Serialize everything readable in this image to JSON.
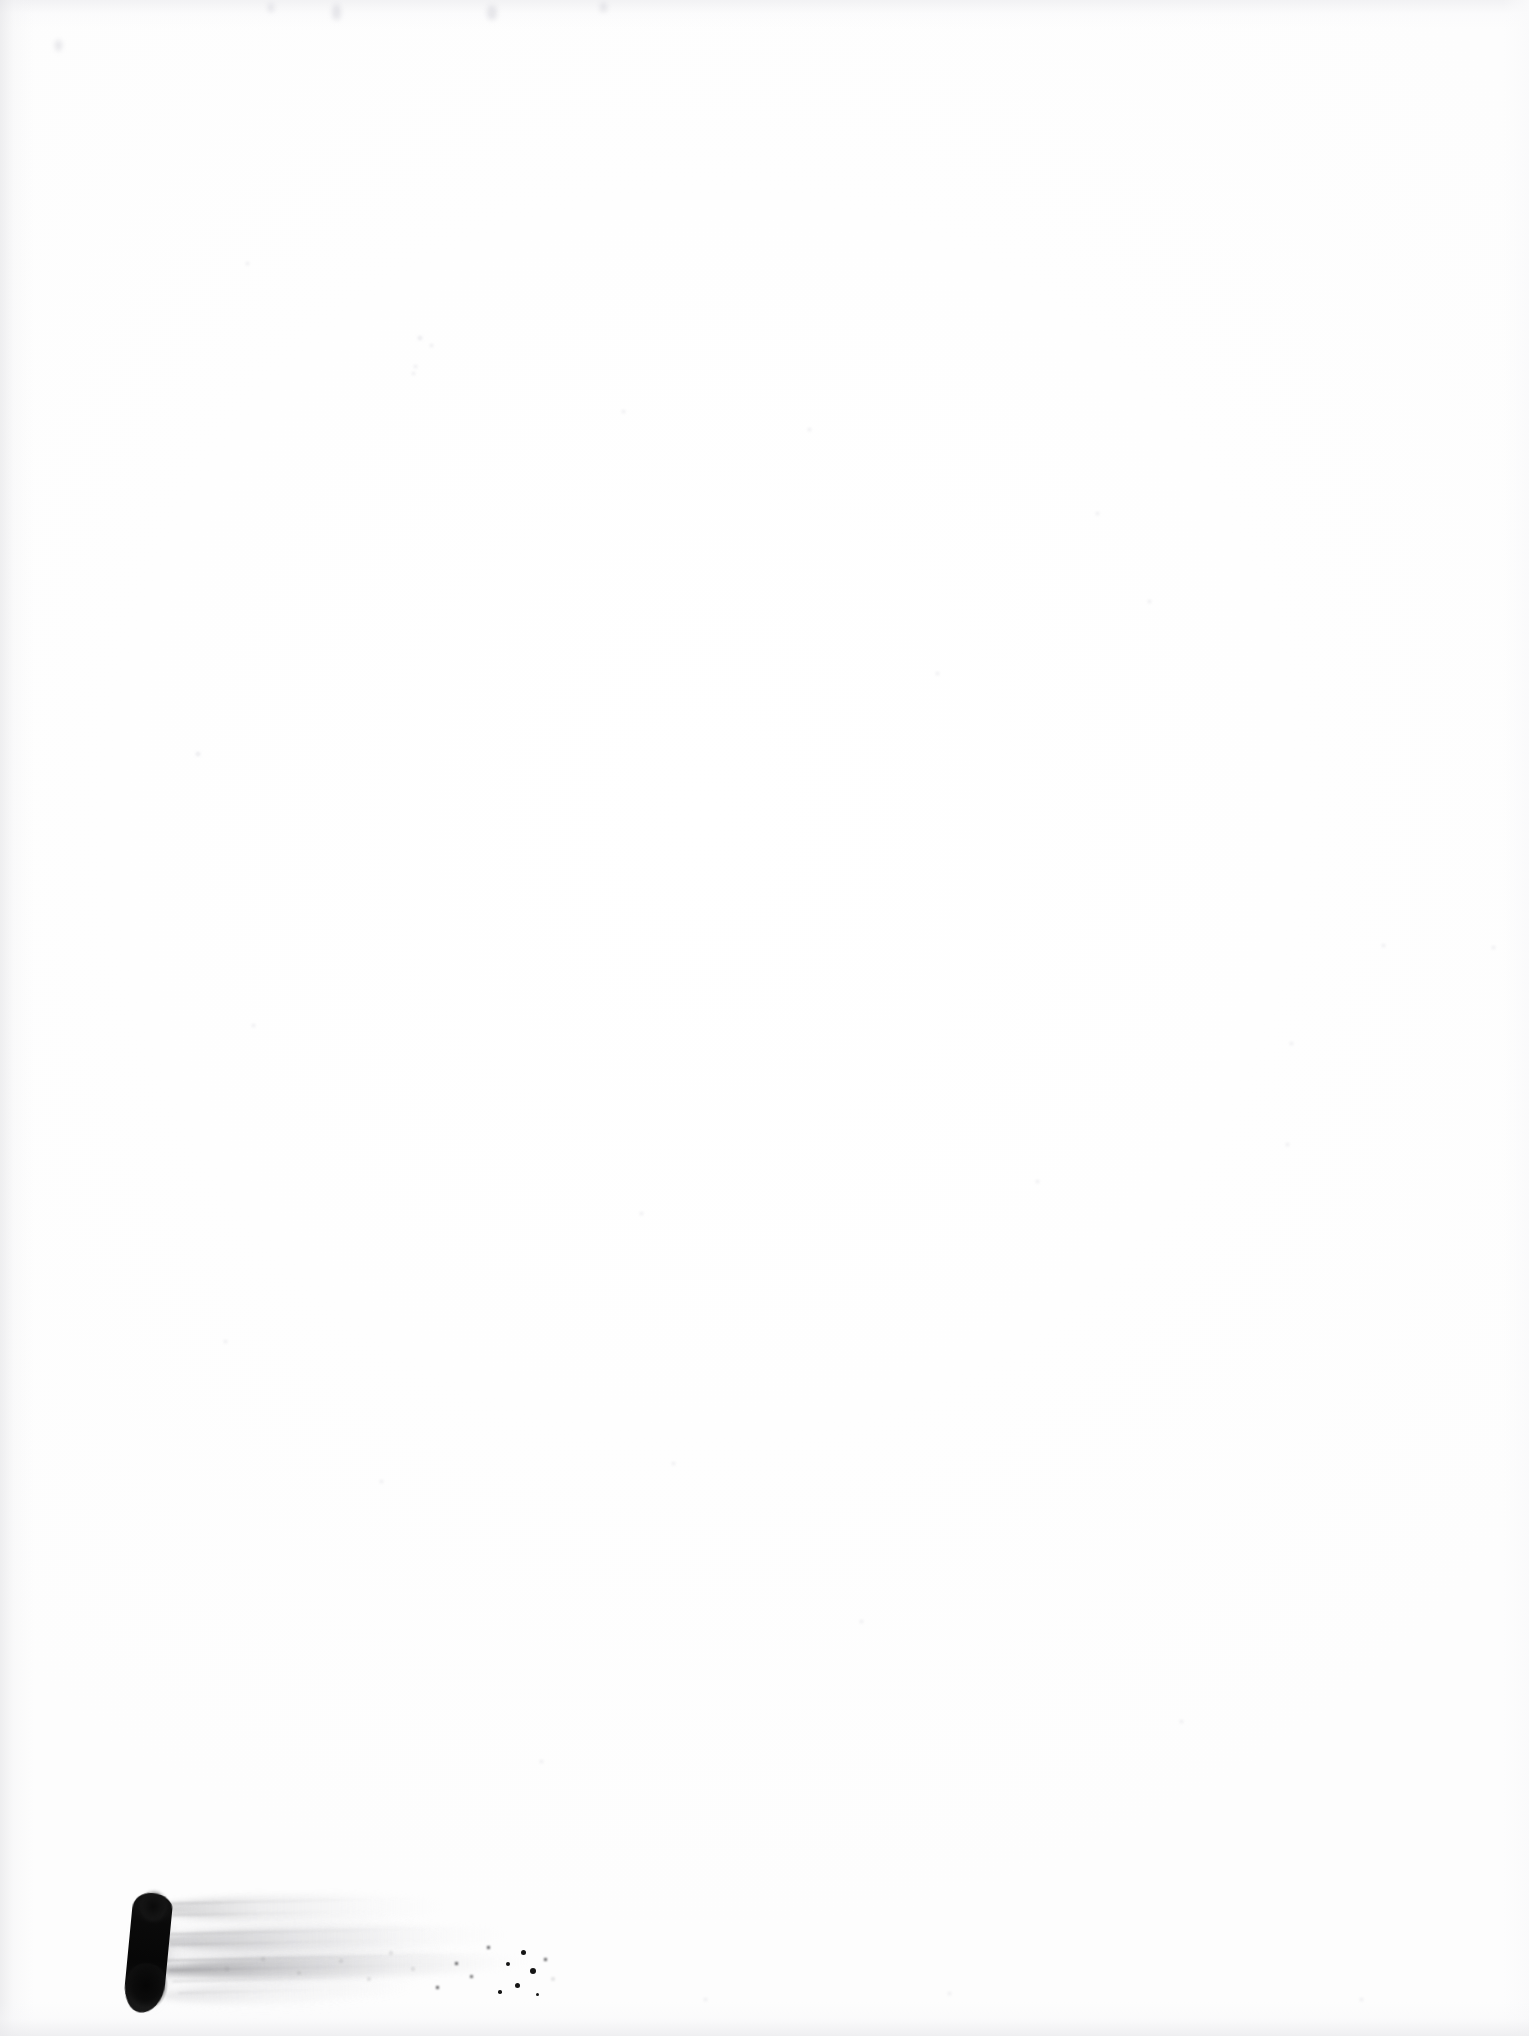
{
  "page": {
    "kind": "scanned-document-page",
    "width_px": 1529,
    "height_px": 2036,
    "background_color": "#fefefe",
    "text_content": "",
    "visible_text_count": 0
  },
  "marks": {
    "primary_stroke": {
      "name": "ink-brush-stroke",
      "color": "#0a0a0a",
      "left_px": 128,
      "top_px": 1888,
      "width_px": 42,
      "height_px": 125,
      "rotation_deg": 5.5
    },
    "streak": {
      "name": "dry-brush-streak",
      "color": "#b4b4b8",
      "left_px": 158,
      "top_px": 1890,
      "width_px": 380,
      "height_px": 120,
      "direction": "left-to-right, fading"
    },
    "bristle_lines": [
      {
        "left": 168,
        "top": 1900,
        "width": 250,
        "opacity": 0.45
      },
      {
        "left": 172,
        "top": 1912,
        "width": 215,
        "opacity": 0.34
      },
      {
        "left": 166,
        "top": 1930,
        "width": 300,
        "opacity": 0.5
      },
      {
        "left": 170,
        "top": 1941,
        "width": 268,
        "opacity": 0.38
      },
      {
        "left": 164,
        "top": 1956,
        "width": 340,
        "opacity": 0.58
      },
      {
        "left": 168,
        "top": 1966,
        "width": 318,
        "opacity": 0.46
      },
      {
        "left": 172,
        "top": 1978,
        "width": 240,
        "opacity": 0.32
      },
      {
        "left": 178,
        "top": 1990,
        "width": 195,
        "opacity": 0.24
      }
    ],
    "specks": [
      {
        "left": 521,
        "top": 1950,
        "size": 5.0,
        "tone": "dark"
      },
      {
        "left": 506,
        "top": 1962,
        "size": 4.0,
        "tone": "dark"
      },
      {
        "left": 530,
        "top": 1968,
        "size": 6.0,
        "tone": "dark"
      },
      {
        "left": 515,
        "top": 1983,
        "size": 5.0,
        "tone": "dark"
      },
      {
        "left": 498,
        "top": 1990,
        "size": 3.5,
        "tone": "dark"
      },
      {
        "left": 536,
        "top": 1993,
        "size": 3.0,
        "tone": "dark"
      },
      {
        "left": 470,
        "top": 1975,
        "size": 3.0,
        "tone": "soft"
      },
      {
        "left": 455,
        "top": 1962,
        "size": 2.5,
        "tone": "soft"
      },
      {
        "left": 487,
        "top": 1946,
        "size": 2.5,
        "tone": "soft"
      },
      {
        "left": 544,
        "top": 1958,
        "size": 2.5,
        "tone": "soft"
      },
      {
        "left": 436,
        "top": 1986,
        "size": 2.5,
        "tone": "soft"
      },
      {
        "left": 412,
        "top": 1968,
        "size": 2.0,
        "tone": "faint"
      },
      {
        "left": 390,
        "top": 1952,
        "size": 2.0,
        "tone": "faint"
      },
      {
        "left": 368,
        "top": 1978,
        "size": 2.0,
        "tone": "faint"
      },
      {
        "left": 340,
        "top": 1960,
        "size": 2.0,
        "tone": "faint"
      },
      {
        "left": 298,
        "top": 1972,
        "size": 2.0,
        "tone": "faint"
      },
      {
        "left": 262,
        "top": 1958,
        "size": 2.0,
        "tone": "faint"
      },
      {
        "left": 226,
        "top": 1968,
        "size": 2.0,
        "tone": "faint"
      },
      {
        "left": 552,
        "top": 1978,
        "size": 2.0,
        "tone": "faint"
      }
    ],
    "top_smudges": [
      {
        "left": 332,
        "top": 4,
        "width": 9,
        "height": 16
      },
      {
        "left": 487,
        "top": 5,
        "width": 10,
        "height": 15
      },
      {
        "left": 600,
        "top": 2,
        "width": 7,
        "height": 10
      },
      {
        "left": 268,
        "top": 3,
        "width": 6,
        "height": 9
      },
      {
        "left": 55,
        "top": 40,
        "width": 7,
        "height": 11
      }
    ],
    "noise_dots": [
      {
        "left": 196,
        "top": 752,
        "size": 4
      },
      {
        "left": 418,
        "top": 336,
        "size": 4
      },
      {
        "left": 414,
        "top": 365,
        "size": 3
      },
      {
        "left": 412,
        "top": 372,
        "size": 3
      },
      {
        "left": 430,
        "top": 344,
        "size": 3
      },
      {
        "left": 246,
        "top": 262,
        "size": 3
      },
      {
        "left": 622,
        "top": 410,
        "size": 3
      },
      {
        "left": 808,
        "top": 428,
        "size": 3
      },
      {
        "left": 1096,
        "top": 512,
        "size": 3
      },
      {
        "left": 1148,
        "top": 600,
        "size": 3
      },
      {
        "left": 936,
        "top": 672,
        "size": 3
      },
      {
        "left": 1382,
        "top": 944,
        "size": 3
      },
      {
        "left": 1492,
        "top": 946,
        "size": 3
      },
      {
        "left": 1290,
        "top": 1042,
        "size": 3
      },
      {
        "left": 1286,
        "top": 1143,
        "size": 3
      },
      {
        "left": 252,
        "top": 1024,
        "size": 3
      },
      {
        "left": 224,
        "top": 1340,
        "size": 3
      },
      {
        "left": 640,
        "top": 1212,
        "size": 3
      },
      {
        "left": 672,
        "top": 1462,
        "size": 3
      },
      {
        "left": 1036,
        "top": 1180,
        "size": 3
      },
      {
        "left": 380,
        "top": 1480,
        "size": 3
      },
      {
        "left": 860,
        "top": 1620,
        "size": 3
      },
      {
        "left": 1180,
        "top": 1720,
        "size": 3
      },
      {
        "left": 540,
        "top": 1760,
        "size": 3
      },
      {
        "left": 948,
        "top": 1992,
        "size": 3
      },
      {
        "left": 1360,
        "top": 1998,
        "size": 3
      },
      {
        "left": 704,
        "top": 1998,
        "size": 3
      }
    ]
  }
}
